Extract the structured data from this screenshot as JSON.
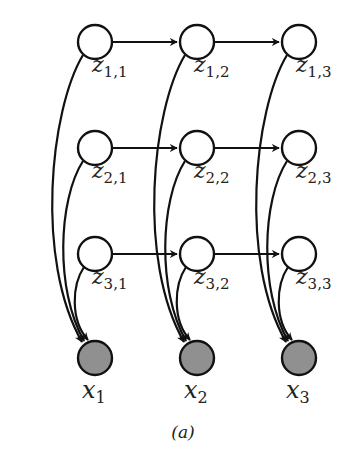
{
  "figure": {
    "caption": "(a)",
    "colors": {
      "latent_fill": "#ffffff",
      "observed_fill": "#909090",
      "stroke": "#111111"
    },
    "latent_nodes": [
      {
        "id": "z11",
        "base": "z",
        "sub": "1,1",
        "row": 1,
        "col": 1
      },
      {
        "id": "z12",
        "base": "z",
        "sub": "1,2",
        "row": 1,
        "col": 2
      },
      {
        "id": "z13",
        "base": "z",
        "sub": "1,3",
        "row": 1,
        "col": 3
      },
      {
        "id": "z21",
        "base": "z",
        "sub": "2,1",
        "row": 2,
        "col": 1
      },
      {
        "id": "z22",
        "base": "z",
        "sub": "2,2",
        "row": 2,
        "col": 2
      },
      {
        "id": "z23",
        "base": "z",
        "sub": "2,3",
        "row": 2,
        "col": 3
      },
      {
        "id": "z31",
        "base": "z",
        "sub": "3,1",
        "row": 3,
        "col": 1
      },
      {
        "id": "z32",
        "base": "z",
        "sub": "3,2",
        "row": 3,
        "col": 2
      },
      {
        "id": "z33",
        "base": "z",
        "sub": "3,3",
        "row": 3,
        "col": 3
      }
    ],
    "observed_nodes": [
      {
        "id": "x1",
        "base": "x",
        "sub": "1",
        "col": 1
      },
      {
        "id": "x2",
        "base": "x",
        "sub": "2",
        "col": 2
      },
      {
        "id": "x3",
        "base": "x",
        "sub": "3",
        "col": 3
      }
    ],
    "edges": [
      [
        "z11",
        "z12"
      ],
      [
        "z12",
        "z13"
      ],
      [
        "z21",
        "z22"
      ],
      [
        "z22",
        "z23"
      ],
      [
        "z31",
        "z32"
      ],
      [
        "z32",
        "z33"
      ],
      [
        "z11",
        "x1"
      ],
      [
        "z21",
        "x1"
      ],
      [
        "z31",
        "x1"
      ],
      [
        "z12",
        "x2"
      ],
      [
        "z22",
        "x2"
      ],
      [
        "z32",
        "x2"
      ],
      [
        "z13",
        "x3"
      ],
      [
        "z23",
        "x3"
      ],
      [
        "z33",
        "x3"
      ]
    ]
  }
}
